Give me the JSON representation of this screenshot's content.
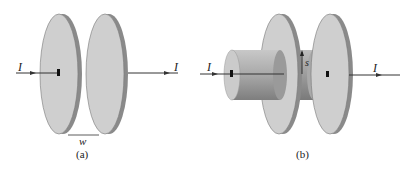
{
  "figure_a": {
    "caption": "(a)",
    "current_in_label": "I",
    "current_out_label": "I",
    "gap_label": "w"
  },
  "figure_b": {
    "caption": "(b)",
    "current_in_label": "I",
    "current_out_label": "I",
    "radius_label": "s"
  },
  "colors": {
    "plate_face": "#cfcfcf",
    "plate_edge": "#8a8a8a",
    "cylinder_light": "#d0d0d0",
    "cylinder_dark": "#888888",
    "line": "#333333"
  }
}
